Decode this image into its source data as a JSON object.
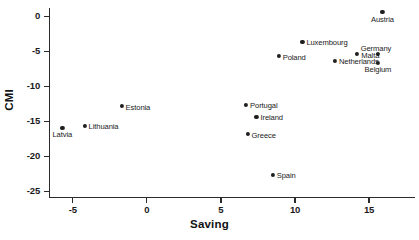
{
  "chart_data": {
    "type": "scatter",
    "title": "",
    "xlabel": "Saving",
    "ylabel": "CMI",
    "xlim": [
      -6.6,
      18.1
    ],
    "ylim": [
      -25.8,
      1.2
    ],
    "xticks": [
      -5,
      0,
      5,
      10,
      15
    ],
    "xticklabels": [
      "-5",
      "0",
      "5",
      "10",
      "15"
    ],
    "yticks": [
      0,
      -5,
      -10,
      -15,
      -20,
      -25
    ],
    "yticklabels": [
      "0",
      "-5",
      "-10",
      "-15",
      "-20",
      "-25"
    ],
    "grid": false,
    "legend": false,
    "marker_color": "#1f1f1f",
    "axis_color": "#2b2b2b",
    "background": "#ffffff",
    "points": [
      {
        "label": "Austria",
        "x": 15.9,
        "y": 0.6,
        "label_pos": "below"
      },
      {
        "label": "Luxembourg",
        "x": 10.5,
        "y": -3.6,
        "label_pos": "right"
      },
      {
        "label": "Germany",
        "x": 15.6,
        "y": -5.4,
        "label_pos": "above"
      },
      {
        "label": "Malta",
        "x": 14.2,
        "y": -5.4,
        "label_pos": "right"
      },
      {
        "label": "Poland",
        "x": 8.9,
        "y": -5.7,
        "label_pos": "right"
      },
      {
        "label": "Netherlands",
        "x": 12.7,
        "y": -6.3,
        "label_pos": "right"
      },
      {
        "label": "Belgium",
        "x": 15.6,
        "y": -6.6,
        "label_pos": "below"
      },
      {
        "label": "Portugal",
        "x": 6.7,
        "y": -12.6,
        "label_pos": "right"
      },
      {
        "label": "Estonia",
        "x": -1.7,
        "y": -12.8,
        "label_pos": "right"
      },
      {
        "label": "Ireland",
        "x": 7.4,
        "y": -14.3,
        "label_pos": "right"
      },
      {
        "label": "Latvia",
        "x": -5.7,
        "y": -15.9,
        "label_pos": "below"
      },
      {
        "label": "Lithuania",
        "x": -4.2,
        "y": -15.6,
        "label_pos": "right"
      },
      {
        "label": "Greece",
        "x": 6.8,
        "y": -16.8,
        "label_pos": "right"
      },
      {
        "label": "Spain",
        "x": 8.5,
        "y": -22.6,
        "label_pos": "right"
      }
    ]
  }
}
